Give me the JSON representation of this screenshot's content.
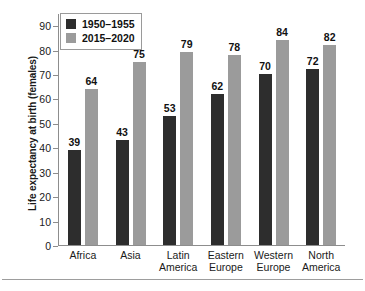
{
  "chart_data": {
    "type": "bar",
    "title": "",
    "xlabel": "",
    "ylabel": "Life expectancy at birth (females)",
    "categories": [
      "Africa",
      "Asia",
      "Latin America",
      "Eastern Europe",
      "Western Europe",
      "North America"
    ],
    "category_lines": [
      [
        "Africa"
      ],
      [
        "Asia"
      ],
      [
        "Latin",
        "America"
      ],
      [
        "Eastern",
        "Europe"
      ],
      [
        "Western",
        "Europe"
      ],
      [
        "North",
        "America"
      ]
    ],
    "series": [
      {
        "name": "1950–1955",
        "color": "#2d2d2d",
        "values": [
          39,
          43,
          53,
          62,
          70,
          72
        ]
      },
      {
        "name": "2015–2020",
        "color": "#9b9b9b",
        "values": [
          64,
          75,
          79,
          78,
          84,
          82
        ]
      }
    ],
    "ylim": [
      0,
      95
    ],
    "yticks": [
      0,
      10,
      20,
      30,
      40,
      50,
      60,
      70,
      80,
      90
    ],
    "ytick_labels": [
      "0",
      "10",
      "20",
      "30",
      "40",
      "50",
      "60",
      "70",
      "80",
      "90"
    ],
    "grid": false,
    "legend_position": "top-left",
    "data_labels": true
  },
  "legend": {
    "items": [
      {
        "label": "1950–1955",
        "swatch": "dark-square-swatch"
      },
      {
        "label": "2015–2020",
        "swatch": "gray-square-swatch"
      }
    ]
  }
}
